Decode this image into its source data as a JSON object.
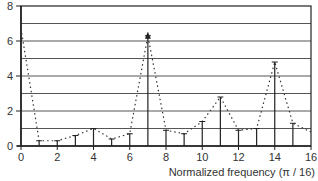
{
  "chart_data": {
    "type": "stem",
    "title": "",
    "xlabel": "Normalized frequency (π / 16)",
    "ylabel": "",
    "xlim": [
      0,
      16
    ],
    "ylim": [
      0,
      8
    ],
    "x_ticks": [
      0,
      2,
      4,
      6,
      8,
      10,
      12,
      14,
      16
    ],
    "y_ticks": [
      0,
      2,
      4,
      6,
      8
    ],
    "grid": {
      "horizontal": true,
      "step": 1,
      "vertical": false
    },
    "x": [
      0,
      1,
      2,
      3,
      4,
      5,
      6,
      7,
      8,
      9,
      10,
      11,
      12,
      13,
      14,
      15,
      16
    ],
    "series": [
      {
        "name": "magnitude spectrum (samples)",
        "style": "stem",
        "values": [
          6.7,
          0.3,
          0.3,
          0.6,
          1.0,
          0.4,
          0.7,
          6.3,
          0.9,
          0.7,
          1.4,
          2.8,
          0.9,
          1.0,
          4.8,
          1.3,
          0.8
        ]
      },
      {
        "name": "interpolated envelope",
        "style": "dotted-line",
        "values": [
          6.7,
          0.3,
          0.3,
          0.6,
          1.0,
          0.4,
          0.7,
          6.3,
          0.9,
          0.7,
          1.4,
          2.8,
          0.9,
          1.0,
          4.8,
          1.3,
          0.8
        ]
      }
    ],
    "annotations": [
      {
        "x": 7,
        "y": 6.3,
        "text": "arrow-tip on peak"
      }
    ],
    "legend": null
  },
  "colors": {
    "axis": "#222222",
    "grid": "#555555",
    "stem": "#222222",
    "envelope": "#333333",
    "text": "#333333",
    "background": "#ffffff"
  }
}
